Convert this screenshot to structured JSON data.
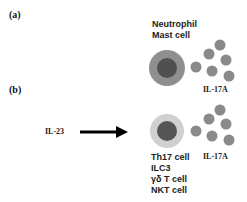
{
  "panels": {
    "a": {
      "label": "(a)",
      "cell_labels": [
        "Neutrophil",
        "Mast cell"
      ],
      "cytokine": "IL-17A"
    },
    "b": {
      "label": "(b)",
      "stimulus": "IL-23",
      "cell_labels": [
        "Th17 cell",
        "ILC3",
        "γδ T cell",
        "NKT cell"
      ],
      "cytokine": "IL-17A"
    }
  },
  "colors": {
    "cell_a_outer": "#8f8f8f",
    "cell_a_nucleus": "#505050",
    "cell_b_outer": "#d0d0d0",
    "cell_b_nucleus": "#555555",
    "cytokine_dot": "#8a8a8a",
    "arrow": "#000000"
  }
}
